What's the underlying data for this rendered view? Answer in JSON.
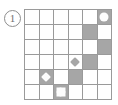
{
  "figure": {
    "label": "1",
    "label_icon": "circled-number-icon"
  },
  "board": {
    "rows": 6,
    "cols": 6,
    "colors": {
      "grid_line": "#9a9a9a",
      "cell_empty": "#ffffff",
      "cell_shaded": "#a6a6a6",
      "piece_white": "#fdfdfd",
      "piece_gray": "#a6a6a6"
    },
    "cells": [
      [
        {
          "shaded": false,
          "piece": null
        },
        {
          "shaded": false,
          "piece": null
        },
        {
          "shaded": false,
          "piece": null
        },
        {
          "shaded": false,
          "piece": null
        },
        {
          "shaded": false,
          "piece": null
        },
        {
          "shaded": true,
          "piece": "circle",
          "piece_fill": "white"
        }
      ],
      [
        {
          "shaded": false,
          "piece": null
        },
        {
          "shaded": false,
          "piece": null
        },
        {
          "shaded": false,
          "piece": null
        },
        {
          "shaded": false,
          "piece": null
        },
        {
          "shaded": true,
          "piece": null
        },
        {
          "shaded": false,
          "piece": null
        }
      ],
      [
        {
          "shaded": false,
          "piece": null
        },
        {
          "shaded": false,
          "piece": null
        },
        {
          "shaded": false,
          "piece": null
        },
        {
          "shaded": false,
          "piece": null
        },
        {
          "shaded": false,
          "piece": null
        },
        {
          "shaded": true,
          "piece": null
        }
      ],
      [
        {
          "shaded": false,
          "piece": null
        },
        {
          "shaded": false,
          "piece": null
        },
        {
          "shaded": false,
          "piece": null
        },
        {
          "shaded": false,
          "piece": "diamond",
          "piece_fill": "gray"
        },
        {
          "shaded": true,
          "piece": null
        },
        {
          "shaded": false,
          "piece": null
        }
      ],
      [
        {
          "shaded": false,
          "piece": null
        },
        {
          "shaded": true,
          "piece": "diamond",
          "piece_fill": "white"
        },
        {
          "shaded": false,
          "piece": null
        },
        {
          "shaded": true,
          "piece": null
        },
        {
          "shaded": false,
          "piece": null
        },
        {
          "shaded": false,
          "piece": null
        }
      ],
      [
        {
          "shaded": false,
          "piece": null
        },
        {
          "shaded": false,
          "piece": null
        },
        {
          "shaded": true,
          "piece": "clover",
          "piece_fill": "white"
        },
        {
          "shaded": false,
          "piece": null
        },
        {
          "shaded": false,
          "piece": null
        },
        {
          "shaded": false,
          "piece": null
        }
      ]
    ]
  }
}
